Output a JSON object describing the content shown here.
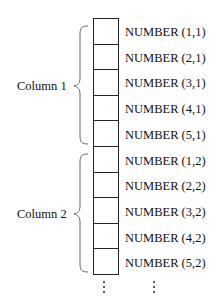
{
  "groups": [
    {
      "label": "Column 1",
      "cells": [
        "NUMBER (1,1)",
        "NUMBER (2,1)",
        "NUMBER (3,1)",
        "NUMBER (4,1)",
        "NUMBER (5,1)"
      ]
    },
    {
      "label": "Column 2",
      "cells": [
        "NUMBER (1,2)",
        "NUMBER (2,2)",
        "NUMBER (3,2)",
        "NUMBER (4,2)",
        "NUMBER (5,2)"
      ]
    }
  ],
  "ellipsis": "⋮"
}
